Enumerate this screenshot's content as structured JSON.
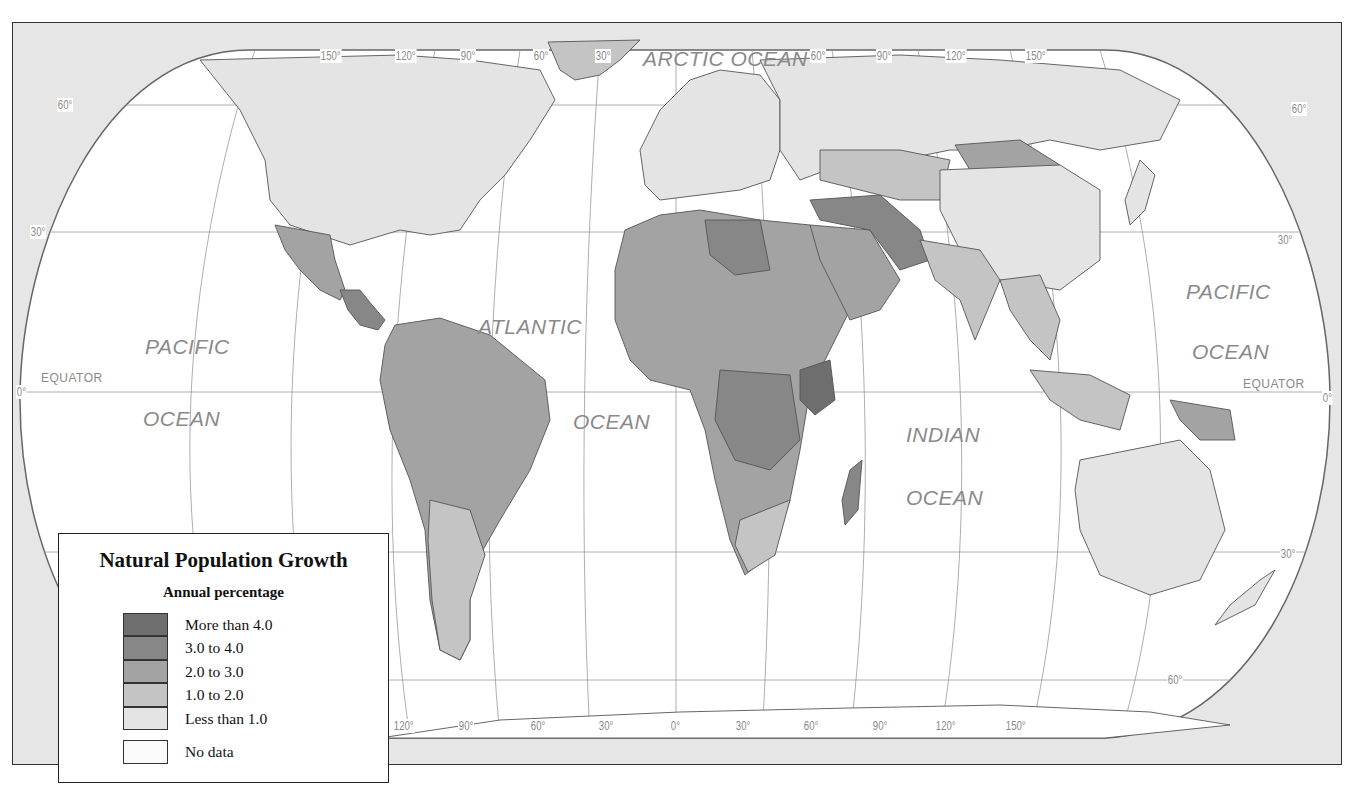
{
  "map": {
    "title": "Natural Population Growth",
    "projection_outline": "rounded-oval world map",
    "colors": {
      "frame_background": "#e6e6e6",
      "ocean": "#ffffff",
      "border_line": "#555555",
      "graticule": "#8a8a8a",
      "label": "#8a8a8a"
    },
    "ocean_labels": {
      "arctic": "ARCTIC OCEAN",
      "pacific_west_1": "PACIFIC",
      "pacific_west_2": "OCEAN",
      "atlantic_1": "ATLANTIC",
      "atlantic_2": "OCEAN",
      "indian_1": "INDIAN",
      "indian_2": "OCEAN",
      "pacific_east_1": "PACIFIC",
      "pacific_east_2": "OCEAN"
    },
    "equator_label_left": "EQUATOR",
    "equator_label_right": "EQUATOR",
    "latitude_labels": {
      "left_60": "60°",
      "left_30": "30°",
      "left_0": "0°",
      "right_60": "60°",
      "right_30": "30°",
      "right_0": "0°",
      "right_s30": "30°",
      "right_s60": "60°"
    },
    "longitude_labels_top": [
      "150°",
      "120°",
      "90°",
      "60°",
      "30°",
      "60°",
      "90°",
      "120°",
      "150°"
    ],
    "longitude_labels_bottom": [
      "120°",
      "90°",
      "60°",
      "30°",
      "0°",
      "30°",
      "60°",
      "90°",
      "120°",
      "150°"
    ]
  },
  "legend": {
    "title": "Natural Population Growth",
    "subtitle": "Annual percentage",
    "classes": [
      {
        "label": "More than 4.0",
        "color": "#6e6e6e"
      },
      {
        "label": "3.0 to 4.0",
        "color": "#878787"
      },
      {
        "label": "2.0 to 3.0",
        "color": "#a3a3a3"
      },
      {
        "label": "1.0 to 2.0",
        "color": "#c4c4c4"
      },
      {
        "label": "Less than 1.0",
        "color": "#e4e4e4"
      }
    ],
    "no_data": {
      "label": "No data",
      "color": "#fafafa"
    }
  }
}
